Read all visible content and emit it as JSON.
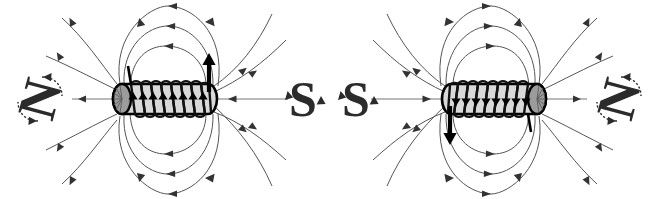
{
  "figure": {
    "background_color": "#ffffff",
    "width": 659,
    "height": 199,
    "line_color": "#555555",
    "arrow_color": "#333333",
    "body_fill": "#d9d9d9",
    "cap_fill": "#9c9c9c",
    "outline_color": "#000000",
    "pole_label_color": "#2b2b2b"
  },
  "diagrams": [
    {
      "id": "left-solenoid",
      "name": "left-solenoid-diagram",
      "center_x": 165,
      "center_y": 99,
      "left_pole": {
        "label": "N",
        "polarity": "north",
        "x": 40,
        "y": 99,
        "rotation_deg": 90
      },
      "right_pole": {
        "label": "S",
        "polarity": "south",
        "x": 303,
        "y": 99,
        "rotation_deg": 0
      },
      "current_direction": "up",
      "field_direction": "clockwise",
      "coil_turns": 8,
      "lead_top_left": true,
      "lead_top_right_arrow": "up"
    },
    {
      "id": "right-solenoid",
      "name": "right-solenoid-diagram",
      "center_x": 494,
      "center_y": 99,
      "left_pole": {
        "label": "S",
        "polarity": "south",
        "x": 356,
        "y": 99,
        "rotation_deg": 0
      },
      "right_pole": {
        "label": "N",
        "polarity": "north",
        "x": 619,
        "y": 99,
        "rotation_deg": 90
      },
      "current_direction": "down",
      "field_direction": "counterclockwise",
      "coil_turns": 8,
      "lead_bottom_left": true,
      "lead_bottom_right_arrow": "down"
    }
  ],
  "labels": {
    "north": "N",
    "south": "S"
  }
}
